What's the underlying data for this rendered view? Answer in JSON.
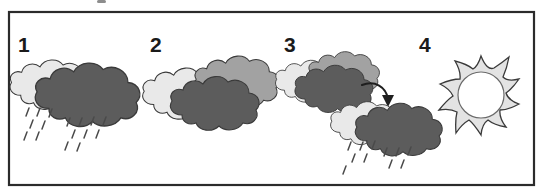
{
  "figure": {
    "panel_count": 4,
    "frame": {
      "x": 8,
      "y": 11,
      "width": 527,
      "height": 175
    },
    "colors": {
      "frame_border": "#2b2b2b",
      "background": "#ffffff",
      "cloud_light": "#e9e9e9",
      "cloud_mid": "#a2a2a2",
      "cloud_dark": "#5c5c5c",
      "outline": "#3a3a3a",
      "rain": "#4a4a4a",
      "arrow": "#1f1f1f",
      "sun_body": "#e3e3e3",
      "sun_core": "#ffffff",
      "number_text": "#1a1a1a"
    }
  },
  "panels": [
    {
      "number": "1",
      "number_x": 18,
      "number_y": 52,
      "description": "light cloud overlapping large dark rain cloud with falling rain",
      "clouds": [
        {
          "tone": "light",
          "cx": 52,
          "cy": 88,
          "scale": 0.92
        },
        {
          "tone": "dark",
          "cx": 89,
          "cy": 99,
          "scale": 1.18
        }
      ],
      "rain": [
        {
          "x": 27,
          "y": 112
        },
        {
          "x": 38,
          "y": 112
        },
        {
          "x": 50,
          "y": 113
        },
        {
          "x": 31,
          "y": 124
        },
        {
          "x": 43,
          "y": 125
        },
        {
          "x": 25,
          "y": 136
        },
        {
          "x": 37,
          "y": 136
        },
        {
          "x": 68,
          "y": 122
        },
        {
          "x": 80,
          "y": 122
        },
        {
          "x": 92,
          "y": 121
        },
        {
          "x": 104,
          "y": 121
        },
        {
          "x": 73,
          "y": 134
        },
        {
          "x": 85,
          "y": 134
        },
        {
          "x": 97,
          "y": 134
        },
        {
          "x": 66,
          "y": 146
        },
        {
          "x": 78,
          "y": 147
        }
      ],
      "arrow": null,
      "sun": null
    },
    {
      "number": "2",
      "number_x": 150,
      "number_y": 52,
      "description": "three clouds clustered together, no rain",
      "clouds": [
        {
          "tone": "light",
          "cx": 186,
          "cy": 97,
          "scale": 0.95
        },
        {
          "tone": "mid",
          "cx": 238,
          "cy": 85,
          "scale": 0.95
        },
        {
          "tone": "dark",
          "cx": 216,
          "cy": 107,
          "scale": 1.0
        }
      ],
      "rain": [],
      "arrow": null,
      "sun": null
    },
    {
      "number": "3",
      "number_x": 284,
      "number_y": 52,
      "description": "upper cloud cluster, curved arrow pointing down-right to a raining cloud pair",
      "clouds": [
        {
          "tone": "light",
          "cx": 311,
          "cy": 84,
          "scale": 0.78
        },
        {
          "tone": "mid",
          "cx": 345,
          "cy": 76,
          "scale": 0.8
        },
        {
          "tone": "dark",
          "cx": 335,
          "cy": 92,
          "scale": 0.88
        },
        {
          "tone": "light",
          "cx": 367,
          "cy": 126,
          "scale": 0.8
        },
        {
          "tone": "dark",
          "cx": 400,
          "cy": 133,
          "scale": 0.98
        }
      ],
      "rain": [
        {
          "x": 349,
          "y": 146
        },
        {
          "x": 361,
          "y": 146
        },
        {
          "x": 373,
          "y": 145
        },
        {
          "x": 353,
          "y": 158
        },
        {
          "x": 365,
          "y": 158
        },
        {
          "x": 344,
          "y": 170
        },
        {
          "x": 385,
          "y": 152
        },
        {
          "x": 397,
          "y": 152
        },
        {
          "x": 409,
          "y": 151
        },
        {
          "x": 390,
          "y": 164
        },
        {
          "x": 402,
          "y": 164
        }
      ],
      "arrow": {
        "label": "transition-arrow",
        "from_x": 362,
        "from_y": 86,
        "to_x": 389,
        "to_y": 104
      },
      "sun": null
    },
    {
      "number": "4",
      "number_x": 419,
      "number_y": 52,
      "description": "sun with pointed rays and open center",
      "clouds": [],
      "rain": [],
      "arrow": null,
      "sun": {
        "cx": 481,
        "cy": 95,
        "outer_radius": 39,
        "inner_radius": 23,
        "core_radius": 22,
        "ray_count": 12
      }
    }
  ],
  "artifact": {
    "name": "clipped-mark-top-edge",
    "x": 97,
    "y": 0,
    "width": 9,
    "height": 3
  }
}
